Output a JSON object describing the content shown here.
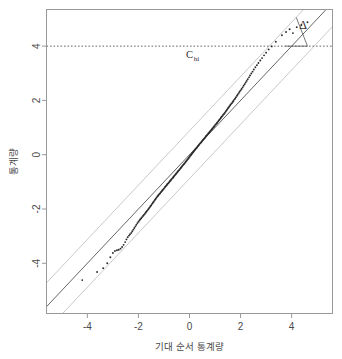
{
  "chart_data": {
    "type": "scatter",
    "title": "",
    "xlabel": "기대 순서 통계량",
    "ylabel": "통계량",
    "xlim": [
      -5.6,
      5.6
    ],
    "ylim": [
      -5.85,
      5.35
    ],
    "xticks": [
      -4,
      -2,
      0,
      2,
      4
    ],
    "yticks": [
      -4,
      -2,
      0,
      2,
      4
    ],
    "xtick_labels": [
      "-4",
      "-2",
      "0",
      "2",
      "4"
    ],
    "ytick_labels": [
      "-4",
      "-2",
      "0",
      "2",
      "4"
    ],
    "grid": false,
    "legend": null,
    "box": true,
    "colors": {
      "points": "#2b2b2b",
      "identity_line": "#555555",
      "band_line": "#c9c9c9",
      "reference_line": "#555555",
      "axis": "#999999",
      "background": "#ffffff"
    },
    "annotations": [
      {
        "name": "c-hi-label",
        "text": "C",
        "subscript": "hi",
        "x": 0.0,
        "y": 3.55
      },
      {
        "name": "delta-symbol",
        "text": "Δ",
        "x": 4.45,
        "y": 4.62
      }
    ],
    "reference_lines": [
      {
        "name": "c-hi-dashed-line",
        "orientation": "horizontal",
        "value": 4,
        "style": "dashed"
      }
    ],
    "fit_lines": [
      {
        "name": "identity-line",
        "slope": 1,
        "intercept": 0,
        "style": "solid"
      },
      {
        "name": "upper-band-line",
        "slope": 1,
        "intercept": 0.88,
        "style": "solid"
      },
      {
        "name": "lower-band-line",
        "slope": 1,
        "intercept": -0.88,
        "style": "solid"
      }
    ],
    "series": [
      {
        "name": "ordered-sample-quantiles",
        "x": [
          -4.2,
          -3.62,
          -3.38,
          -3.22,
          -3.1,
          -3.0,
          -2.92,
          -2.84,
          -2.77,
          -2.7,
          -2.64,
          -2.58,
          -2.52,
          -2.47,
          -2.42,
          -2.37,
          -2.33,
          -2.28,
          -2.24,
          -2.2,
          -2.16,
          -2.12,
          -2.08,
          -2.04,
          -2.0,
          -1.96,
          -1.93,
          -1.89,
          -1.86,
          -1.82,
          -1.79,
          -1.75,
          -1.72,
          -1.69,
          -1.66,
          -1.62,
          -1.59,
          -1.56,
          -1.53,
          -1.5,
          -1.47,
          -1.44,
          -1.41,
          -1.38,
          -1.35,
          -1.32,
          -1.29,
          -1.26,
          -1.23,
          -1.21,
          -1.18,
          -1.15,
          -1.12,
          -1.09,
          -1.07,
          -1.04,
          -1.01,
          -0.98,
          -0.96,
          -0.93,
          -0.9,
          -0.88,
          -0.85,
          -0.82,
          -0.8,
          -0.77,
          -0.74,
          -0.72,
          -0.69,
          -0.66,
          -0.64,
          -0.61,
          -0.59,
          -0.56,
          -0.53,
          -0.51,
          -0.48,
          -0.46,
          -0.43,
          -0.4,
          -0.38,
          -0.35,
          -0.33,
          -0.3,
          -0.28,
          -0.25,
          -0.22,
          -0.2,
          -0.17,
          -0.15,
          -0.12,
          -0.1,
          -0.07,
          -0.05,
          -0.02,
          0.0,
          0.02,
          0.05,
          0.07,
          0.1,
          0.12,
          0.15,
          0.17,
          0.2,
          0.22,
          0.25,
          0.28,
          0.3,
          0.33,
          0.35,
          0.38,
          0.4,
          0.43,
          0.46,
          0.48,
          0.51,
          0.53,
          0.56,
          0.59,
          0.61,
          0.64,
          0.66,
          0.69,
          0.72,
          0.74,
          0.77,
          0.8,
          0.82,
          0.85,
          0.88,
          0.9,
          0.93,
          0.96,
          0.98,
          1.01,
          1.04,
          1.07,
          1.09,
          1.12,
          1.15,
          1.18,
          1.21,
          1.23,
          1.26,
          1.29,
          1.32,
          1.35,
          1.38,
          1.41,
          1.44,
          1.47,
          1.5,
          1.53,
          1.56,
          1.59,
          1.62,
          1.66,
          1.69,
          1.72,
          1.75,
          1.79,
          1.82,
          1.86,
          1.89,
          1.93,
          1.96,
          2.0,
          2.04,
          2.08,
          2.12,
          2.16,
          2.2,
          2.24,
          2.28,
          2.33,
          2.37,
          2.42,
          2.47,
          2.52,
          2.58,
          2.64,
          2.7,
          2.77,
          2.84,
          2.92,
          3.0,
          3.1,
          3.22,
          3.38,
          3.62,
          3.78,
          3.92,
          4.05,
          4.2,
          4.38,
          4.62
        ],
        "y": [
          -4.62,
          -4.32,
          -4.18,
          -4.0,
          -3.78,
          -3.62,
          -3.55,
          -3.52,
          -3.5,
          -3.46,
          -3.4,
          -3.32,
          -3.22,
          -3.12,
          -3.04,
          -2.98,
          -2.93,
          -2.88,
          -2.82,
          -2.76,
          -2.7,
          -2.64,
          -2.58,
          -2.52,
          -2.47,
          -2.42,
          -2.38,
          -2.34,
          -2.3,
          -2.26,
          -2.22,
          -2.18,
          -2.14,
          -2.1,
          -2.06,
          -2.02,
          -1.98,
          -1.94,
          -1.9,
          -1.86,
          -1.82,
          -1.78,
          -1.74,
          -1.7,
          -1.66,
          -1.62,
          -1.58,
          -1.54,
          -1.51,
          -1.48,
          -1.45,
          -1.42,
          -1.38,
          -1.35,
          -1.32,
          -1.29,
          -1.26,
          -1.22,
          -1.19,
          -1.16,
          -1.13,
          -1.1,
          -1.07,
          -1.04,
          -1.01,
          -0.98,
          -0.95,
          -0.92,
          -0.89,
          -0.86,
          -0.83,
          -0.8,
          -0.77,
          -0.74,
          -0.71,
          -0.68,
          -0.65,
          -0.62,
          -0.59,
          -0.56,
          -0.53,
          -0.5,
          -0.47,
          -0.44,
          -0.41,
          -0.38,
          -0.35,
          -0.32,
          -0.29,
          -0.26,
          -0.23,
          -0.2,
          -0.17,
          -0.14,
          -0.11,
          -0.08,
          -0.05,
          -0.02,
          0.01,
          0.04,
          0.07,
          0.1,
          0.13,
          0.16,
          0.19,
          0.22,
          0.25,
          0.28,
          0.31,
          0.34,
          0.37,
          0.4,
          0.43,
          0.46,
          0.49,
          0.52,
          0.55,
          0.58,
          0.61,
          0.64,
          0.67,
          0.7,
          0.73,
          0.76,
          0.79,
          0.82,
          0.85,
          0.88,
          0.91,
          0.94,
          0.97,
          1.0,
          1.03,
          1.06,
          1.1,
          1.13,
          1.16,
          1.19,
          1.23,
          1.26,
          1.3,
          1.33,
          1.36,
          1.4,
          1.43,
          1.47,
          1.5,
          1.54,
          1.58,
          1.62,
          1.66,
          1.7,
          1.74,
          1.78,
          1.82,
          1.86,
          1.9,
          1.94,
          1.98,
          2.03,
          2.07,
          2.12,
          2.17,
          2.22,
          2.27,
          2.32,
          2.37,
          2.42,
          2.48,
          2.54,
          2.6,
          2.66,
          2.72,
          2.78,
          2.85,
          2.92,
          2.99,
          3.06,
          3.14,
          3.22,
          3.3,
          3.38,
          3.47,
          3.56,
          3.66,
          3.76,
          3.88,
          3.99,
          4.16,
          4.4,
          4.52,
          4.62,
          4.48,
          4.7,
          4.78,
          4.88
        ]
      }
    ]
  }
}
